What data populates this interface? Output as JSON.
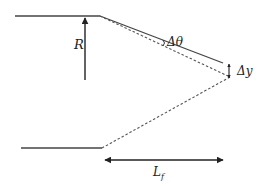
{
  "diagram": {
    "labels": {
      "radius": "R",
      "angle": "Δθ",
      "deflection": "Δy",
      "length_main": "L",
      "length_sub": "f"
    },
    "colors": {
      "line": "#333333",
      "background": "#ffffff"
    },
    "elements": [
      {
        "name": "top-horizontal-line",
        "style": "solid"
      },
      {
        "name": "deflected-line",
        "style": "solid"
      },
      {
        "name": "upper-dashed-line",
        "style": "dashed"
      },
      {
        "name": "lower-dashed-line",
        "style": "dashed"
      },
      {
        "name": "bottom-horizontal-line",
        "style": "solid"
      },
      {
        "name": "radius-arrow",
        "style": "single-arrow"
      },
      {
        "name": "deflection-arrow",
        "style": "double-arrow"
      },
      {
        "name": "length-arrow",
        "style": "double-arrow"
      }
    ]
  }
}
